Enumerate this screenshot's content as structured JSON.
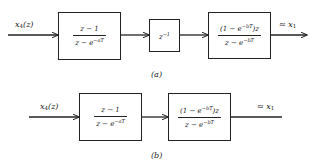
{
  "diagram_a": {
    "caption": "(a)",
    "input_label": {
      "var": "x",
      "sub": "4",
      "arg": "(z)"
    },
    "output_label": {
      "prefix": "≈ ",
      "var": "x",
      "sub": "1"
    },
    "blocks": [
      {
        "type": "fraction",
        "numerator": "z − 1",
        "denominator_base": "z − e",
        "denominator_exp": "−aT"
      },
      {
        "type": "single",
        "base": "z",
        "exp": "−1"
      },
      {
        "type": "fraction",
        "numerator_pre": "(1 − e",
        "numerator_exp": "−bT",
        "numerator_post": ")z",
        "denominator_base": "z − e",
        "denominator_exp": "−bT"
      }
    ]
  },
  "diagram_b": {
    "caption": "(b)",
    "input_label": {
      "var": "x",
      "sub": "4",
      "arg": "(z)"
    },
    "output_label": {
      "prefix": "≈ ",
      "var": "x",
      "sub": "1"
    },
    "blocks": [
      {
        "type": "fraction",
        "numerator": "z − 1",
        "denominator_base": "z − e",
        "denominator_exp": "−aT"
      },
      {
        "type": "fraction",
        "numerator_pre": "(1 − e",
        "numerator_exp": "−bT",
        "numerator_post": ")z",
        "denominator_base": "z − e",
        "denominator_exp": "−bT"
      }
    ]
  },
  "colors": {
    "line": "#222222",
    "background": "#ffffff"
  }
}
